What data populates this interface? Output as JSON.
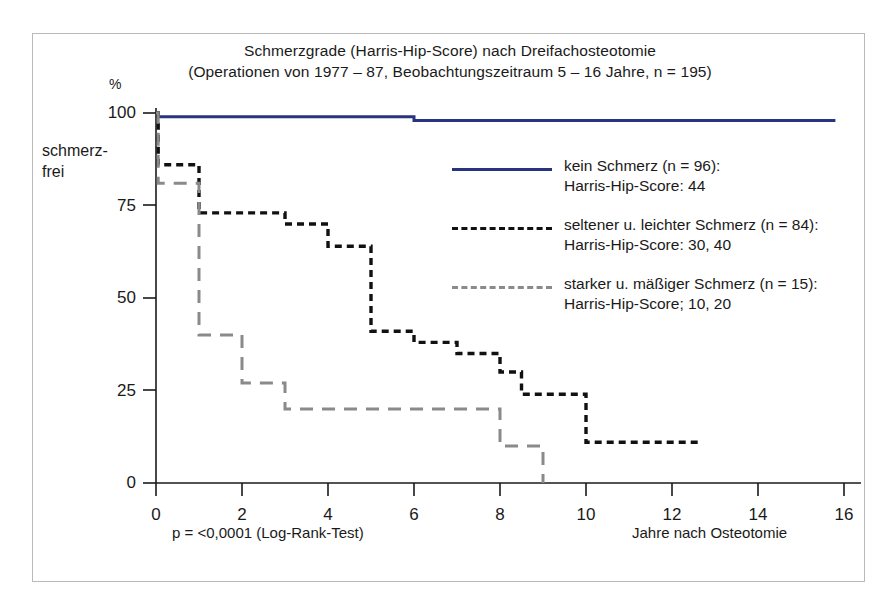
{
  "title": {
    "line1": "Schmerzgrade (Harris-Hip-Score) nach Dreifachosteotomie",
    "line2": "(Operationen von 1977 – 87, Beobachtungszeitraum 5 – 16 Jahre, n = 195)"
  },
  "axes": {
    "y_unit": "%",
    "y_label_line1": "schmerz-",
    "y_label_line2": "frei",
    "x_title": "Jahre nach Osteotomie",
    "p_value": "p = <0,0001 (Log-Rank-Test)",
    "y_ticks": [
      "100",
      "75",
      "50",
      "25",
      "0"
    ],
    "x_ticks": [
      "0",
      "2",
      "4",
      "6",
      "8",
      "10",
      "12",
      "14",
      "16"
    ]
  },
  "legend": [
    {
      "style": "solid",
      "color": "#28357e",
      "line1": "kein Schmerz (n = 96):",
      "line2": "Harris-Hip-Score: 44"
    },
    {
      "style": "dashed-fine",
      "color": "#111111",
      "line1": "seltener u. leichter Schmerz (n = 84):",
      "line2": "Harris-Hip-Score: 30, 40"
    },
    {
      "style": "dashed-long",
      "color": "#8a8a8a",
      "line1": "starker u. mäßiger Schmerz (n = 15):",
      "line2": "Harris-Hip-Score; 10, 20"
    }
  ],
  "chart_data": {
    "type": "line",
    "subtype": "kaplan-meier-step",
    "title": "Schmerzgrade (Harris-Hip-Score) nach Dreifachosteotomie",
    "subtitle": "(Operationen von 1977 – 87, Beobachtungszeitraum 5 – 16 Jahre, n = 195)",
    "xlabel": "Jahre nach Osteotomie",
    "ylabel": "schmerzfrei",
    "yunit": "%",
    "xlim": [
      0,
      16
    ],
    "ylim": [
      0,
      100
    ],
    "xticks": [
      0,
      2,
      4,
      6,
      8,
      10,
      12,
      14,
      16
    ],
    "yticks": [
      0,
      25,
      50,
      75,
      100
    ],
    "grid": false,
    "legend_position": "inside-right",
    "annotation": "p = <0,0001 (Log-Rank-Test)",
    "series": [
      {
        "name": "kein Schmerz (n = 96)",
        "score": "Harris-Hip-Score: 44",
        "n": 96,
        "color": "#28357e",
        "style": "solid",
        "steps": [
          {
            "x": 0.0,
            "y": 99
          },
          {
            "x": 6.0,
            "y": 98
          },
          {
            "x": 15.8,
            "y": 98
          }
        ]
      },
      {
        "name": "seltener u. leichter Schmerz (n = 84)",
        "score": "Harris-Hip-Score: 30, 40",
        "n": 84,
        "color": "#111111",
        "style": "dashed-fine",
        "steps": [
          {
            "x": 0.0,
            "y": 100
          },
          {
            "x": 0.05,
            "y": 86
          },
          {
            "x": 1.0,
            "y": 73
          },
          {
            "x": 3.0,
            "y": 70
          },
          {
            "x": 4.0,
            "y": 64
          },
          {
            "x": 5.0,
            "y": 41
          },
          {
            "x": 6.0,
            "y": 38
          },
          {
            "x": 7.0,
            "y": 35
          },
          {
            "x": 8.0,
            "y": 30
          },
          {
            "x": 8.5,
            "y": 24
          },
          {
            "x": 10.0,
            "y": 11
          },
          {
            "x": 12.6,
            "y": 11
          }
        ]
      },
      {
        "name": "starker u. mäßiger Schmerz (n = 15)",
        "score": "Harris-Hip-Score; 10, 20",
        "n": 15,
        "color": "#8a8a8a",
        "style": "dashed-long",
        "steps": [
          {
            "x": 0.0,
            "y": 100
          },
          {
            "x": 0.05,
            "y": 81
          },
          {
            "x": 1.0,
            "y": 40
          },
          {
            "x": 2.0,
            "y": 27
          },
          {
            "x": 3.0,
            "y": 20
          },
          {
            "x": 8.0,
            "y": 10
          },
          {
            "x": 9.0,
            "y": 0
          }
        ]
      }
    ]
  }
}
